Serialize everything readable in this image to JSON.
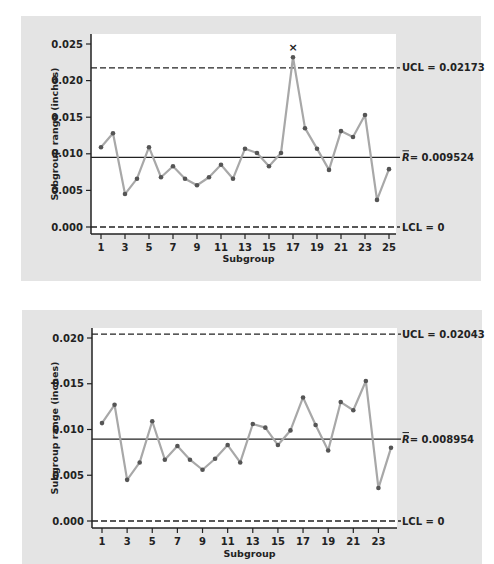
{
  "chart_data": [
    {
      "type": "line",
      "title": "R chart (all 25 subgroups)",
      "xlabel": "Subgroup",
      "ylabel": "Subgroup range (inches)",
      "x": [
        1,
        2,
        3,
        4,
        5,
        6,
        7,
        8,
        9,
        10,
        11,
        12,
        13,
        14,
        15,
        16,
        17,
        18,
        19,
        20,
        21,
        22,
        23,
        24,
        25
      ],
      "series": [
        {
          "name": "Subgroup range",
          "values": [
            0.0109,
            0.0128,
            0.0045,
            0.0066,
            0.0109,
            0.0068,
            0.0083,
            0.0066,
            0.0057,
            0.0068,
            0.0085,
            0.0066,
            0.0107,
            0.0101,
            0.0083,
            0.0101,
            0.0232,
            0.0135,
            0.0107,
            0.0078,
            0.0131,
            0.0123,
            0.0153,
            0.0037,
            0.0079
          ]
        }
      ],
      "x_ticks": [
        "1",
        "3",
        "5",
        "7",
        "9",
        "11",
        "13",
        "15",
        "17",
        "19",
        "21",
        "23",
        "25"
      ],
      "y_ticks": [
        "0.000",
        "0.005",
        "0.010",
        "0.015",
        "0.020",
        "0.025"
      ],
      "ylim": [
        0,
        0.025
      ],
      "xlim": [
        1,
        25
      ],
      "control_lines": {
        "ucl": {
          "value": 0.02173,
          "label": "UCL = 0.02173",
          "style": "dashed"
        },
        "center": {
          "value": 0.009524,
          "label_symbol": "R",
          "label_value": "= 0.009524",
          "style": "solid"
        },
        "lcl": {
          "value": 0,
          "label": "LCL = 0",
          "style": "dashed"
        }
      },
      "annotations": [
        {
          "x": 17,
          "marker": "×",
          "note": "out-of-control point above UCL"
        }
      ],
      "grid": false,
      "legend": "none"
    },
    {
      "type": "line",
      "title": "R chart (subgroup 17 removed)",
      "xlabel": "Subgroup",
      "ylabel": "Subgroup range (inches)",
      "x": [
        1,
        2,
        3,
        4,
        5,
        6,
        7,
        8,
        9,
        10,
        11,
        12,
        13,
        14,
        15,
        16,
        17,
        18,
        19,
        20,
        21,
        22,
        23,
        24
      ],
      "series": [
        {
          "name": "Subgroup range",
          "values": [
            0.0107,
            0.0127,
            0.0045,
            0.0064,
            0.0109,
            0.0067,
            0.0082,
            0.0067,
            0.0056,
            0.0068,
            0.0083,
            0.0064,
            0.0106,
            0.0102,
            0.0083,
            0.0099,
            0.0135,
            0.0105,
            0.0077,
            0.013,
            0.0121,
            0.0153,
            0.0036,
            0.008
          ]
        }
      ],
      "x_ticks": [
        "1",
        "3",
        "5",
        "7",
        "9",
        "11",
        "13",
        "15",
        "17",
        "19",
        "21",
        "23"
      ],
      "y_ticks": [
        "0.000",
        "0.005",
        "0.010",
        "0.015",
        "0.020"
      ],
      "ylim": [
        0,
        0.02
      ],
      "xlim": [
        1,
        24
      ],
      "control_lines": {
        "ucl": {
          "value": 0.02043,
          "label": "UCL = 0.02043",
          "style": "dashed"
        },
        "center": {
          "value": 0.008954,
          "label_symbol": "R",
          "label_value": "= 0.008954",
          "style": "solid"
        },
        "lcl": {
          "value": 0,
          "label": "LCL = 0",
          "style": "dashed"
        }
      },
      "grid": false,
      "legend": "none"
    }
  ],
  "colors": {
    "panel_bg": "#e4e4e4",
    "plot_bg": "#ffffff",
    "series_line": "#a8a8a8",
    "marker": "#555555",
    "axis": "#222222"
  }
}
